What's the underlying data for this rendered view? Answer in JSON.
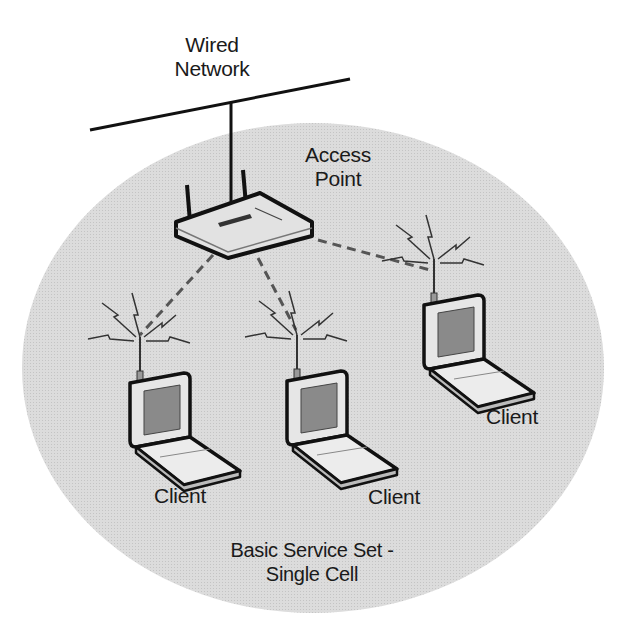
{
  "diagram": {
    "title": "Basic Service Set - Single Cell",
    "wired_network": {
      "label_line1": "Wired",
      "label_line2": "Network"
    },
    "access_point": {
      "label_line1": "Access",
      "label_line2": "Point"
    },
    "cell": {
      "label_line1": "Basic Service Set -",
      "label_line2": "Single Cell",
      "fill": "#d6d6d6"
    },
    "clients": [
      {
        "label": "Client"
      },
      {
        "label": "Client"
      },
      {
        "label": "Client"
      }
    ],
    "colors": {
      "line": "#111111",
      "dash": "#555555",
      "device_body": "#e4e4e4",
      "screen": "#8a8a8a"
    }
  }
}
